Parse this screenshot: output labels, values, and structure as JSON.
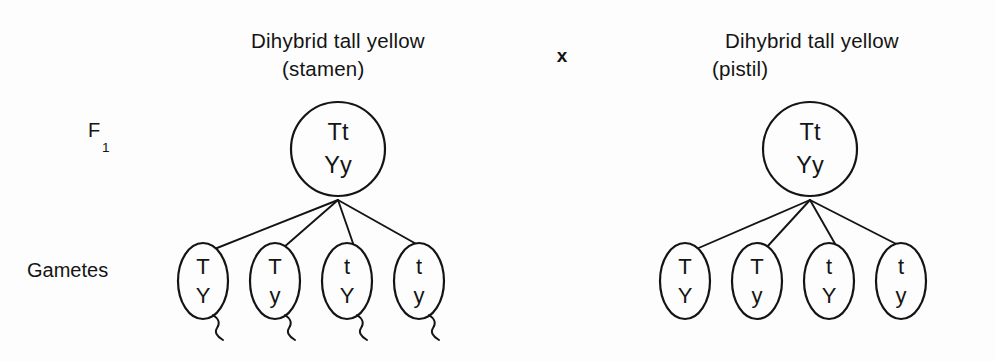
{
  "figure": {
    "title_left_line1": "Dihybrid tall yellow",
    "title_left_line2": "(stamen)",
    "cross_symbol": "x",
    "title_right_line1": "Dihybrid tall yellow",
    "title_right_line2": "(pistil)",
    "generation_label": "F",
    "generation_subscript": "1",
    "gametes_label": "Gametes",
    "ink_color": "#141414",
    "background_color": "#fdfdfd"
  },
  "parents": [
    {
      "side": "left",
      "role": "stamen",
      "allele_line1": "Tt",
      "allele_line2": "Yy"
    },
    {
      "side": "right",
      "role": "pistil",
      "allele_line1": "Tt",
      "allele_line2": "Yy"
    }
  ],
  "gametes": {
    "left": [
      {
        "allele_line1": "T",
        "allele_line2": "Y",
        "has_tail": true
      },
      {
        "allele_line1": "T",
        "allele_line2": "y",
        "has_tail": true
      },
      {
        "allele_line1": "t",
        "allele_line2": "Y",
        "has_tail": true
      },
      {
        "allele_line1": "t",
        "allele_line2": "y",
        "has_tail": true
      }
    ],
    "right": [
      {
        "allele_line1": "T",
        "allele_line2": "Y",
        "has_tail": false
      },
      {
        "allele_line1": "T",
        "allele_line2": "y",
        "has_tail": false
      },
      {
        "allele_line1": "t",
        "allele_line2": "Y",
        "has_tail": false
      },
      {
        "allele_line1": "t",
        "allele_line2": "y",
        "has_tail": false
      }
    ]
  }
}
